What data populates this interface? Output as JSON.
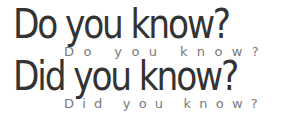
{
  "lines": [
    {
      "big": "Do you know?",
      "small": "Do you know?"
    },
    {
      "big": "Did you know?",
      "small": "Did you know?"
    }
  ],
  "colors": {
    "big_text": "#333333",
    "small_text": "#7a7a7a",
    "background": "#ffffff"
  }
}
